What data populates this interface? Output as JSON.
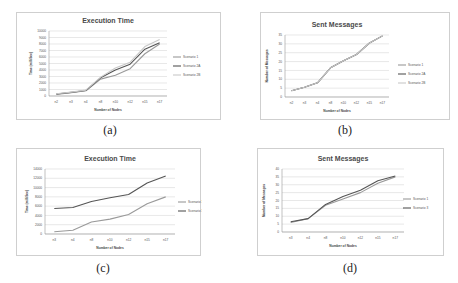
{
  "captions": [
    "(a)",
    "(b)",
    "(c)",
    "(d)"
  ],
  "chart_data": [
    {
      "id": "a",
      "type": "line",
      "title": "Execution Time",
      "xlabel": "Number of Nodes",
      "ylabel": "Time (milliSec)",
      "categories": [
        "n2",
        "n3",
        "n4",
        "n8",
        "n10",
        "n12",
        "n15",
        "n17"
      ],
      "ylim": [
        0,
        10000
      ],
      "yticks": [
        0,
        1000,
        2000,
        3000,
        4000,
        5000,
        6000,
        7000,
        8000,
        9000,
        10000
      ],
      "grid": true,
      "legend_position": "right",
      "series": [
        {
          "name": "Scenario 1",
          "color": "#9a9a9a",
          "values": [
            250,
            500,
            800,
            2600,
            3200,
            4200,
            6500,
            8000
          ]
        },
        {
          "name": "Scenario 2A",
          "color": "#555555",
          "values": [
            300,
            550,
            850,
            2800,
            4000,
            4900,
            7200,
            8200
          ]
        },
        {
          "name": "Scenario 2B",
          "color": "#c8c8c8",
          "values": [
            350,
            600,
            900,
            2900,
            4300,
            5200,
            7600,
            8700
          ]
        }
      ]
    },
    {
      "id": "b",
      "type": "line",
      "title": "Sent Messages",
      "xlabel": "Number of Nodes",
      "ylabel": "Number of Messages",
      "categories": [
        "n2",
        "n3",
        "n4",
        "n8",
        "n10",
        "n12",
        "n15",
        "n17"
      ],
      "ylim": [
        0,
        35
      ],
      "yticks": [
        0,
        5,
        10,
        15,
        20,
        25,
        30,
        35
      ],
      "grid": true,
      "legend_position": "right",
      "series": [
        {
          "name": "Scenario 1",
          "color": "#9a9a9a",
          "values": [
            3.5,
            5.5,
            8,
            16.5,
            20.5,
            24,
            30.5,
            34.5
          ]
        },
        {
          "name": "Scenario 2A",
          "color": "#555555",
          "values": [
            3.5,
            5.5,
            8,
            16.5,
            20.5,
            24,
            30.5,
            34.5
          ]
        },
        {
          "name": "Scenario 2B",
          "color": "#c8c8c8",
          "values": [
            3.5,
            5.5,
            8,
            16.5,
            20.5,
            24,
            30.5,
            34.5
          ]
        }
      ]
    },
    {
      "id": "c",
      "type": "line",
      "title": "Execution Time",
      "xlabel": "Number of Nodes",
      "ylabel": "Time (milliSec)",
      "categories": [
        "n3",
        "n4",
        "n8",
        "n10",
        "n12",
        "n15",
        "n17"
      ],
      "ylim": [
        0,
        14000
      ],
      "yticks": [
        0,
        2000,
        4000,
        6000,
        8000,
        10000,
        12000,
        14000
      ],
      "grid": true,
      "legend_position": "right",
      "series": [
        {
          "name": "Scenario 1",
          "color": "#9a9a9a",
          "values": [
            500,
            800,
            2600,
            3200,
            4200,
            6500,
            8000
          ]
        },
        {
          "name": "Scenario 3",
          "color": "#555555",
          "values": [
            5500,
            5700,
            7000,
            7800,
            8500,
            11000,
            12500
          ]
        }
      ]
    },
    {
      "id": "d",
      "type": "line",
      "title": "Sent Messages",
      "xlabel": "Number of Nodes",
      "ylabel": "Number of Messages",
      "categories": [
        "n3",
        "n4",
        "n8",
        "n10",
        "n12",
        "n15",
        "n17"
      ],
      "ylim": [
        0,
        40
      ],
      "yticks": [
        0,
        5,
        10,
        15,
        20,
        25,
        30,
        35,
        40
      ],
      "grid": true,
      "legend_position": "right",
      "series": [
        {
          "name": "Scenario 1",
          "color": "#9a9a9a",
          "values": [
            6,
            8.5,
            17,
            21,
            25,
            31,
            35
          ]
        },
        {
          "name": "Scenario 3",
          "color": "#555555",
          "values": [
            6.5,
            8.5,
            17.5,
            22.5,
            26.5,
            32.5,
            35.5
          ]
        }
      ]
    }
  ]
}
